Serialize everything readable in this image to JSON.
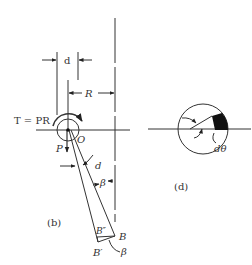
{
  "figure": {
    "labels": {
      "torque": "T = PR",
      "d_top": "d",
      "R": "R",
      "O": "O",
      "P": "P",
      "d_mid": "d",
      "beta_mid": "β",
      "panel_b": "(b)",
      "B_double_prime": "B″",
      "B": "B",
      "B_prime": "B′",
      "beta_bottom": "β",
      "panel_d": "(d)",
      "dtheta": "dθ"
    },
    "colors": {
      "line": "#333333",
      "fill": "#111111",
      "background": "#ffffff"
    }
  }
}
